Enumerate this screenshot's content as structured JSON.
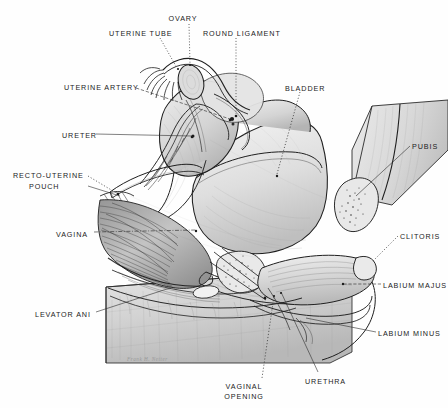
{
  "figure": {
    "medium": "pencil anatomical illustration",
    "signature": "Frank H. Netter",
    "ink_color": "#1b1b1b",
    "paper_color": "#fefefe",
    "wash_color": "#c9c9c9"
  },
  "labels": [
    {
      "id": "ovary",
      "text": "OVARY",
      "x": 183,
      "y": 14,
      "align": "center",
      "w": 46
    },
    {
      "id": "uterine-tube",
      "text": "UTERINE TUBE",
      "x": 109,
      "y": 29,
      "align": "left",
      "w": 62
    },
    {
      "id": "round-ligament",
      "text": "ROUND LIGAMENT",
      "x": 203,
      "y": 29,
      "align": "left",
      "w": 76
    },
    {
      "id": "uterine-artery",
      "text": "UTERINE ARTERY",
      "x": 64,
      "y": 83,
      "align": "left",
      "w": 76
    },
    {
      "id": "bladder",
      "text": "BLADDER",
      "x": 285,
      "y": 84,
      "align": "left",
      "w": 42
    },
    {
      "id": "ureter",
      "text": "URETER",
      "x": 62,
      "y": 131,
      "align": "left",
      "w": 34
    },
    {
      "id": "pubis",
      "text": "PUBIS",
      "x": 412,
      "y": 142,
      "align": "left",
      "w": 30
    },
    {
      "id": "recto-uterine-pouch-1",
      "text": "RECTO-UTERINE",
      "x": 13,
      "y": 171,
      "align": "left",
      "w": 74
    },
    {
      "id": "recto-uterine-pouch-2",
      "text": "POUCH",
      "x": 29,
      "y": 182,
      "align": "left",
      "w": 42
    },
    {
      "id": "vagina",
      "text": "VAGINA",
      "x": 56,
      "y": 230,
      "align": "left",
      "w": 36
    },
    {
      "id": "clitoris",
      "text": "CLITORIS",
      "x": 400,
      "y": 232,
      "align": "left",
      "w": 42
    },
    {
      "id": "labium-majus",
      "text": "LABIUM MAJUS",
      "x": 383,
      "y": 281,
      "align": "left",
      "w": 66
    },
    {
      "id": "levator-ani",
      "text": "LEVATOR ANI",
      "x": 35,
      "y": 310,
      "align": "left",
      "w": 60
    },
    {
      "id": "labium-minus",
      "text": "LABIUM MINUS",
      "x": 378,
      "y": 329,
      "align": "left",
      "w": 66
    },
    {
      "id": "urethra",
      "text": "URETHRA",
      "x": 305,
      "y": 377,
      "align": "left",
      "w": 42
    },
    {
      "id": "vaginal-opening-1",
      "text": "VAGINAL",
      "x": 244,
      "y": 382,
      "align": "center",
      "w": 44
    },
    {
      "id": "vaginal-opening-2",
      "text": "OPENING",
      "x": 244,
      "y": 392,
      "align": "center",
      "w": 44
    }
  ],
  "signature": {
    "text": "Frank H. Netter",
    "x": 127,
    "y": 356
  }
}
